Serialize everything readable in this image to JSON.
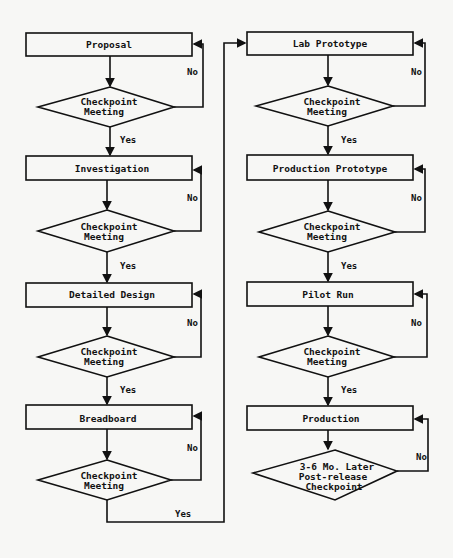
{
  "diagram": {
    "type": "flowchart",
    "left_column": {
      "stages": [
        {
          "label": "Proposal",
          "decision": [
            "Checkpoint",
            "Meeting"
          ]
        },
        {
          "label": "Investigation",
          "decision": [
            "Checkpoint",
            "Meeting"
          ]
        },
        {
          "label": "Detailed Design",
          "decision": [
            "Checkpoint",
            "Meeting"
          ]
        },
        {
          "label": "Breadboard",
          "decision": [
            "Checkpoint",
            "Meeting"
          ]
        }
      ]
    },
    "right_column": {
      "stages": [
        {
          "label": "Lab Prototype",
          "decision": [
            "Checkpoint",
            "Meeting"
          ]
        },
        {
          "label": "Production Prototype",
          "decision": [
            "Checkpoint",
            "Meeting"
          ]
        },
        {
          "label": "Pilot Run",
          "decision": [
            "Checkpoint",
            "Meeting"
          ]
        },
        {
          "label": "Production",
          "decision": [
            "3-6 Mo. Later",
            "Post-release",
            "Checkpoint"
          ]
        }
      ]
    },
    "edge_labels": {
      "yes": "Yes",
      "no": "No"
    },
    "colors": {
      "line": "#111111",
      "background": "#f7f7f5",
      "box_fill": "#f7f7f5"
    }
  }
}
